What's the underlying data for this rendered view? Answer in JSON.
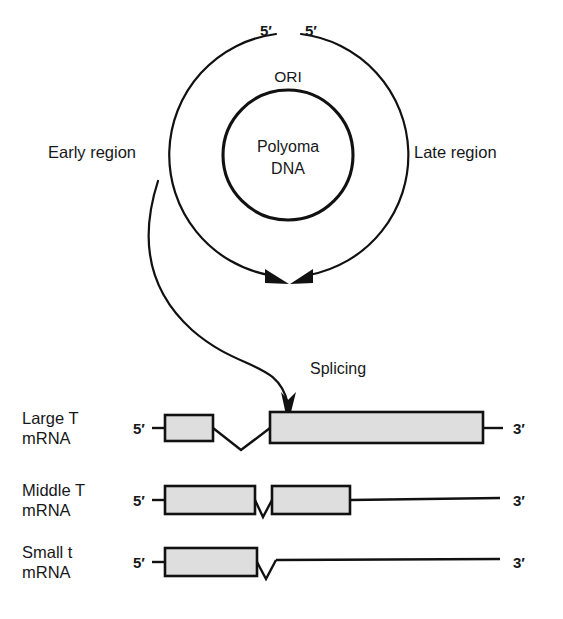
{
  "figure": {
    "genome_map": {
      "center_label_line1": "Polyoma",
      "center_label_line2": "DNA",
      "origin_label": "ORI",
      "left_region_label": "Early region",
      "right_region_label": "Late region",
      "five_prime_left": "5′",
      "five_prime_right": "5′",
      "inner_circle": {
        "cx": 288,
        "cy": 155,
        "r": 65
      },
      "outer_arc_radius": 122,
      "transcript_arrowheads": 2
    },
    "splicing": {
      "label": "Splicing",
      "arrow_from": "early region transcript",
      "arrow_to": "Large T mRNA"
    },
    "transcripts": [
      {
        "name": "Large T mRNA",
        "label_line1": "Large T",
        "label_line2": "mRNA",
        "five_prime": "5′",
        "three_prime": "3′",
        "exons": [
          {
            "x": 165,
            "width": 48
          },
          {
            "x": 270,
            "width": 213
          }
        ],
        "intron_count": 1,
        "line_end_x": 503
      },
      {
        "name": "Middle T mRNA",
        "label_line1": "Middle T",
        "label_line2": "mRNA",
        "five_prime": "5′",
        "three_prime": "3′",
        "exons": [
          {
            "x": 165,
            "width": 90
          },
          {
            "x": 272,
            "width": 78
          }
        ],
        "intron_count": 1,
        "line_end_x": 500
      },
      {
        "name": "Small t mRNA",
        "label_line1": "Small  t",
        "label_line2": "mRNA",
        "five_prime": "5′",
        "three_prime": "3′",
        "exons": [
          {
            "x": 165,
            "width": 92
          }
        ],
        "intron_count": 1,
        "line_end_x": 500
      }
    ],
    "colors": {
      "ink": "#111111",
      "exon_fill": "#dedede",
      "background": "#ffffff"
    }
  }
}
